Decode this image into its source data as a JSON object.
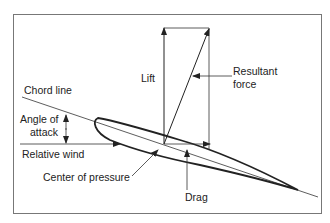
{
  "diagram": {
    "labels": {
      "lift": "Lift",
      "resultant_line1": "Resultant",
      "resultant_line2": "force",
      "chord_line": "Chord line",
      "angle_line1": "Angle of",
      "angle_line2": "attack",
      "relative_wind": "Relative wind",
      "center_of_pressure": "Center of pressure",
      "drag": "Drag"
    },
    "colors": {
      "line": "#222222",
      "frame": "#777777",
      "background": "#ffffff"
    }
  }
}
